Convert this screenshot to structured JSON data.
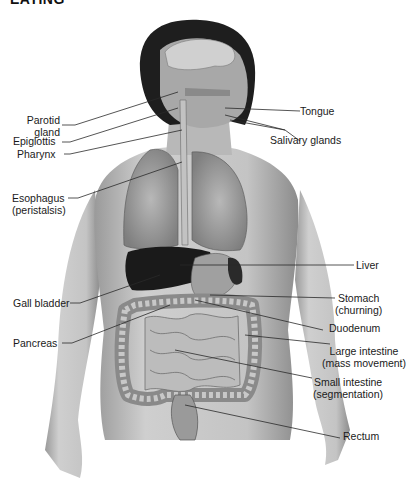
{
  "heading": "EATING",
  "figure": {
    "colors": {
      "skin": "#c9c9c9",
      "hair": "#1e1e1e",
      "liver": "#1a1a1a",
      "organ": "#a8a8a8",
      "lungs": "#9a9a9a",
      "intestine": "#b5b5b5",
      "leader": "#2a2a2a"
    }
  },
  "labels_left": [
    {
      "id": "parotid",
      "line1": "Parotid",
      "line2": "gland"
    },
    {
      "id": "epiglottis",
      "line1": "Epiglottis"
    },
    {
      "id": "pharynx",
      "line1": "Pharynx"
    },
    {
      "id": "esophagus",
      "line1": "Esophagus",
      "line2": "(peristalsis)"
    },
    {
      "id": "gallbladder",
      "line1": "Gall bladder"
    },
    {
      "id": "pancreas",
      "line1": "Pancreas"
    }
  ],
  "labels_right": [
    {
      "id": "tongue",
      "line1": "Tongue"
    },
    {
      "id": "salivary",
      "line1": "Salivary glands"
    },
    {
      "id": "liver",
      "line1": "Liver"
    },
    {
      "id": "stomach",
      "line1": "Stomach",
      "line2": "(churning)"
    },
    {
      "id": "duodenum",
      "line1": "Duodenum"
    },
    {
      "id": "large-intestine",
      "line1": "Large intestine",
      "line2": "(mass movement)"
    },
    {
      "id": "small-intestine",
      "line1": "Small intestine",
      "line2": "(segmentation)"
    },
    {
      "id": "rectum",
      "line1": "Rectum"
    }
  ]
}
